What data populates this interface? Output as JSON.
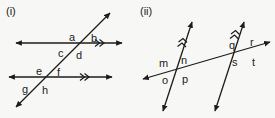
{
  "figure_set": {
    "background_color": "#f7f7f5",
    "ink_color": "#1c1c1c",
    "width": 275,
    "height": 118
  },
  "figures": [
    {
      "caption": "(i)",
      "description": "Two parallel horizontal lines cut by a transversal",
      "parallel_mark_count": 2,
      "angle_labels": [
        {
          "text": "a",
          "x": 69,
          "y": 32
        },
        {
          "text": "b",
          "x": 91,
          "y": 33
        },
        {
          "text": "c",
          "x": 58,
          "y": 48
        },
        {
          "text": "d",
          "x": 76,
          "y": 50
        },
        {
          "text": "e",
          "x": 36,
          "y": 66
        },
        {
          "text": "f",
          "x": 57,
          "y": 67
        },
        {
          "text": "g",
          "x": 22,
          "y": 84
        },
        {
          "text": "h",
          "x": 42,
          "y": 85
        }
      ]
    },
    {
      "caption": "(ii)",
      "description": "Two parallel slanted lines cut by a transversal",
      "parallel_mark_count": 2,
      "angle_labels": [
        {
          "text": "m",
          "x": 159,
          "y": 58
        },
        {
          "text": "n",
          "x": 181,
          "y": 55
        },
        {
          "text": "o",
          "x": 162,
          "y": 75
        },
        {
          "text": "p",
          "x": 182,
          "y": 74
        },
        {
          "text": "q",
          "x": 229,
          "y": 40
        },
        {
          "text": "r",
          "x": 250,
          "y": 37
        },
        {
          "text": "s",
          "x": 232,
          "y": 57
        },
        {
          "text": "t",
          "x": 252,
          "y": 57
        }
      ]
    }
  ]
}
